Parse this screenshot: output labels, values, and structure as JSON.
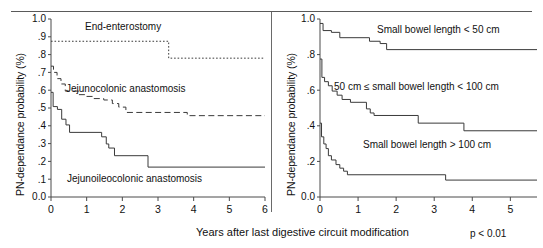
{
  "figure": {
    "xaxis_title": "Years after last digestive circuit modification",
    "pvalue": "p < 0.01"
  },
  "chart_data": [
    {
      "type": "line",
      "panel": "left",
      "title": "",
      "xlabel": "Years after last digestive circuit modification",
      "ylabel": "PN-dependance probability (%)",
      "xlim": [
        0,
        6
      ],
      "ylim": [
        0,
        1
      ],
      "xticks": [
        0,
        1,
        2,
        3,
        4,
        5,
        6
      ],
      "xticklabels": [
        "0",
        "1",
        "2",
        "3",
        "4",
        "5",
        "6"
      ],
      "yticks": [
        0.0,
        0.1,
        0.2,
        0.3,
        0.4,
        0.5,
        0.6,
        0.7,
        0.8,
        0.9,
        1.0
      ],
      "yticklabels": [
        "0.0",
        ".1",
        ".2",
        ".3",
        ".4",
        ".5",
        ".6",
        ".7",
        ".8",
        ".9",
        "1.0"
      ],
      "grid": false,
      "legend": "inline-annotations",
      "series": [
        {
          "name": "End-enterostomy",
          "style": "dotted",
          "label_text": "End-enterostomy",
          "points": [
            [
              0.0,
              0.875
            ],
            [
              3.3,
              0.875
            ],
            [
              3.3,
              0.78
            ],
            [
              6.0,
              0.78
            ]
          ]
        },
        {
          "name": "Jejunocolonic anastomosis",
          "style": "dashed",
          "label_text": "Jejunocolonic anastomosis",
          "points": [
            [
              0.0,
              0.735
            ],
            [
              0.07,
              0.735
            ],
            [
              0.07,
              0.7
            ],
            [
              0.17,
              0.7
            ],
            [
              0.17,
              0.665
            ],
            [
              0.28,
              0.665
            ],
            [
              0.28,
              0.635
            ],
            [
              0.4,
              0.635
            ],
            [
              0.4,
              0.595
            ],
            [
              0.78,
              0.595
            ],
            [
              0.78,
              0.575
            ],
            [
              0.95,
              0.575
            ],
            [
              0.95,
              0.565
            ],
            [
              1.2,
              0.565
            ],
            [
              1.2,
              0.553
            ],
            [
              1.48,
              0.553
            ],
            [
              1.48,
              0.545
            ],
            [
              1.72,
              0.545
            ],
            [
              1.72,
              0.525
            ],
            [
              1.9,
              0.525
            ],
            [
              1.9,
              0.505
            ],
            [
              2.1,
              0.505
            ],
            [
              2.1,
              0.475
            ],
            [
              3.82,
              0.475
            ],
            [
              3.82,
              0.457
            ],
            [
              6.0,
              0.457
            ]
          ]
        },
        {
          "name": "Jejunoileocolonic anastomosis",
          "style": "solid",
          "label_text": "Jejunoileocolonic anastomosis",
          "points": [
            [
              0.0,
              0.588
            ],
            [
              0.06,
              0.588
            ],
            [
              0.06,
              0.508
            ],
            [
              0.18,
              0.508
            ],
            [
              0.18,
              0.492
            ],
            [
              0.3,
              0.492
            ],
            [
              0.3,
              0.437
            ],
            [
              0.42,
              0.437
            ],
            [
              0.42,
              0.405
            ],
            [
              0.52,
              0.405
            ],
            [
              0.52,
              0.363
            ],
            [
              1.42,
              0.363
            ],
            [
              1.42,
              0.338
            ],
            [
              1.55,
              0.338
            ],
            [
              1.55,
              0.298
            ],
            [
              1.62,
              0.298
            ],
            [
              1.62,
              0.275
            ],
            [
              1.78,
              0.275
            ],
            [
              1.78,
              0.232
            ],
            [
              2.72,
              0.232
            ],
            [
              2.72,
              0.168
            ],
            [
              6.0,
              0.168
            ]
          ]
        }
      ]
    },
    {
      "type": "line",
      "panel": "right",
      "title": "",
      "xlabel": "Years after last digestive circuit modification",
      "ylabel": "PN-dependance probability (%)",
      "xlim": [
        0,
        5.7
      ],
      "ylim": [
        0,
        1
      ],
      "xticks": [
        0,
        1,
        2,
        3,
        4,
        5
      ],
      "xticklabels": [
        "0",
        "1",
        "2",
        "3",
        "4",
        "5"
      ],
      "yticks": [
        0.0,
        0.2,
        0.4,
        0.6,
        0.8,
        1.0
      ],
      "yticklabels": [
        "0.0",
        ".2",
        ".4",
        ".6",
        ".8",
        "1.0"
      ],
      "grid": false,
      "legend": "inline-annotations",
      "series": [
        {
          "name": "Small bowel length < 50 cm",
          "style": "solid",
          "label_text": "Small bowel length < 50 cm",
          "points": [
            [
              0.0,
              0.975
            ],
            [
              0.08,
              0.975
            ],
            [
              0.08,
              0.935
            ],
            [
              0.3,
              0.935
            ],
            [
              0.3,
              0.925
            ],
            [
              0.52,
              0.925
            ],
            [
              0.52,
              0.895
            ],
            [
              1.3,
              0.895
            ],
            [
              1.3,
              0.875
            ],
            [
              1.58,
              0.875
            ],
            [
              1.58,
              0.862
            ],
            [
              1.75,
              0.862
            ],
            [
              1.75,
              0.828
            ],
            [
              5.7,
              0.828
            ]
          ]
        },
        {
          "name": "50 cm ≤ small bowel length < 100 cm",
          "style": "solid",
          "label_text": "50 cm ≤ small bowel length < 100 cm",
          "points": [
            [
              0.0,
              0.775
            ],
            [
              0.05,
              0.775
            ],
            [
              0.05,
              0.672
            ],
            [
              0.12,
              0.672
            ],
            [
              0.12,
              0.648
            ],
            [
              0.22,
              0.648
            ],
            [
              0.22,
              0.625
            ],
            [
              0.32,
              0.625
            ],
            [
              0.32,
              0.595
            ],
            [
              0.45,
              0.595
            ],
            [
              0.45,
              0.572
            ],
            [
              0.58,
              0.572
            ],
            [
              0.58,
              0.548
            ],
            [
              0.8,
              0.548
            ],
            [
              0.8,
              0.532
            ],
            [
              1.22,
              0.532
            ],
            [
              1.22,
              0.495
            ],
            [
              1.32,
              0.495
            ],
            [
              1.32,
              0.472
            ],
            [
              1.42,
              0.472
            ],
            [
              1.42,
              0.458
            ],
            [
              2.58,
              0.458
            ],
            [
              2.58,
              0.415
            ],
            [
              3.78,
              0.415
            ],
            [
              3.78,
              0.372
            ],
            [
              5.7,
              0.372
            ]
          ]
        },
        {
          "name": "Small bowel length > 100 cm",
          "style": "solid",
          "label_text": "Small bowel length > 100 cm",
          "points": [
            [
              0.0,
              0.415
            ],
            [
              0.04,
              0.415
            ],
            [
              0.04,
              0.338
            ],
            [
              0.1,
              0.338
            ],
            [
              0.1,
              0.298
            ],
            [
              0.16,
              0.298
            ],
            [
              0.16,
              0.272
            ],
            [
              0.22,
              0.272
            ],
            [
              0.22,
              0.232
            ],
            [
              0.3,
              0.232
            ],
            [
              0.3,
              0.208
            ],
            [
              0.42,
              0.208
            ],
            [
              0.42,
              0.182
            ],
            [
              0.52,
              0.182
            ],
            [
              0.52,
              0.162
            ],
            [
              0.62,
              0.162
            ],
            [
              0.62,
              0.145
            ],
            [
              0.72,
              0.145
            ],
            [
              0.72,
              0.125
            ],
            [
              3.3,
              0.125
            ],
            [
              3.3,
              0.095
            ],
            [
              5.7,
              0.095
            ]
          ]
        }
      ]
    }
  ]
}
